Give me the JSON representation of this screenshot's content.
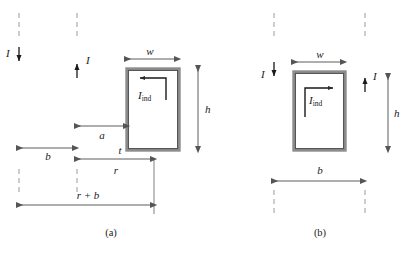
{
  "figure": {
    "type": "physics-diagram",
    "colors": {
      "wire": "#8a8a8a",
      "wire_dark": "#6f6f6f",
      "loop_border": "#7d7d7d",
      "loop_inner": "#4a4a4a",
      "dash": "#9a9a9a",
      "arrow": "#1a1a1a",
      "dim_line": "#4a4a4a",
      "text": "#1a1a1a",
      "background": "#ffffff"
    },
    "panels": [
      {
        "id": "a",
        "caption": "(a)",
        "wires": [
          {
            "name": "wire-left",
            "current_label": "I",
            "direction": "down"
          },
          {
            "name": "wire-right",
            "current_label": "I",
            "direction": "up"
          }
        ],
        "loop": {
          "name": "induced-loop",
          "current_label": "I",
          "current_subscript": "ind",
          "current_direction": "counterclockwise",
          "arrow_points": "left",
          "position": "right of both wires"
        },
        "dimensions": [
          {
            "name": "b",
            "label": "b",
            "from": "wire-left",
            "to": "wire-right",
            "orientation": "horizontal"
          },
          {
            "name": "a",
            "label": "a",
            "from": "wire-right",
            "to": "loop-left-edge",
            "orientation": "horizontal"
          },
          {
            "name": "t",
            "label": "t",
            "from": "wire-right",
            "to": "loop-right-edge",
            "orientation": "horizontal"
          },
          {
            "name": "r",
            "label": "r",
            "from": "wire-right",
            "to": "loop-right-edge",
            "orientation": "horizontal"
          },
          {
            "name": "r-plus-b",
            "label": "r + b",
            "from": "wire-left",
            "to": "loop-right-edge",
            "orientation": "horizontal"
          },
          {
            "name": "w",
            "label": "w",
            "span": "loop width",
            "orientation": "horizontal"
          },
          {
            "name": "h",
            "label": "h",
            "span": "loop height",
            "orientation": "vertical"
          }
        ]
      },
      {
        "id": "b",
        "caption": "(b)",
        "wires": [
          {
            "name": "wire-left",
            "current_label": "I",
            "direction": "down"
          },
          {
            "name": "wire-right",
            "current_label": "I",
            "direction": "up"
          }
        ],
        "loop": {
          "name": "induced-loop",
          "current_label": "I",
          "current_subscript": "ind",
          "current_direction": "clockwise",
          "arrow_points": "right",
          "position": "between the two wires"
        },
        "dimensions": [
          {
            "name": "w",
            "label": "w",
            "span": "loop width",
            "orientation": "horizontal"
          },
          {
            "name": "h",
            "label": "h",
            "span": "loop height",
            "orientation": "vertical"
          },
          {
            "name": "b",
            "label": "b",
            "from": "wire-left",
            "to": "wire-right",
            "orientation": "horizontal"
          }
        ]
      }
    ]
  }
}
